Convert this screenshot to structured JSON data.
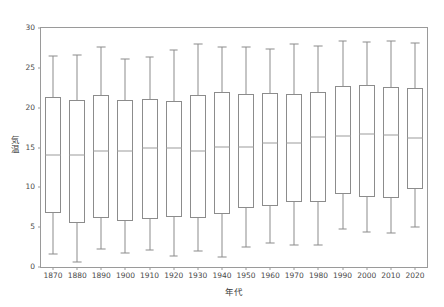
{
  "chart_data": {
    "type": "boxplot",
    "title": "",
    "xlabel": "年代",
    "ylabel": "気温",
    "ylim": [
      0,
      30
    ],
    "yticks": [
      0,
      5,
      10,
      15,
      20,
      25,
      30
    ],
    "ytick_labels": [
      "0",
      "5",
      "10",
      "15",
      "20",
      "25",
      "30"
    ],
    "grid": false,
    "legend": null,
    "categories": [
      "1870",
      "1880",
      "1890",
      "1900",
      "1910",
      "1920",
      "1930",
      "1940",
      "1950",
      "1960",
      "1970",
      "1980",
      "1990",
      "2000",
      "2010",
      "2020"
    ],
    "boxes": [
      {
        "category": "1870",
        "whisker_low": 1.6,
        "q1": 6.8,
        "median": 14.1,
        "q3": 21.3,
        "whisker_high": 26.5
      },
      {
        "category": "1880",
        "whisker_low": 0.6,
        "q1": 5.5,
        "median": 14.1,
        "q3": 20.9,
        "whisker_high": 26.6
      },
      {
        "category": "1890",
        "whisker_low": 2.2,
        "q1": 6.2,
        "median": 14.5,
        "q3": 21.6,
        "whisker_high": 27.6
      },
      {
        "category": "1900",
        "whisker_low": 1.7,
        "q1": 5.8,
        "median": 14.5,
        "q3": 20.9,
        "whisker_high": 26.1
      },
      {
        "category": "1910",
        "whisker_low": 2.1,
        "q1": 6.0,
        "median": 15.0,
        "q3": 21.1,
        "whisker_high": 26.4
      },
      {
        "category": "1920",
        "whisker_low": 1.4,
        "q1": 6.3,
        "median": 15.0,
        "q3": 20.8,
        "whisker_high": 27.3
      },
      {
        "category": "1930",
        "whisker_low": 2.0,
        "q1": 6.2,
        "median": 14.6,
        "q3": 21.6,
        "whisker_high": 28.0
      },
      {
        "category": "1940",
        "whisker_low": 1.3,
        "q1": 6.6,
        "median": 15.1,
        "q3": 22.0,
        "whisker_high": 27.6
      },
      {
        "category": "1950",
        "whisker_low": 2.5,
        "q1": 7.4,
        "median": 15.1,
        "q3": 21.7,
        "whisker_high": 27.6
      },
      {
        "category": "1960",
        "whisker_low": 3.0,
        "q1": 7.6,
        "median": 15.6,
        "q3": 21.9,
        "whisker_high": 27.4
      },
      {
        "category": "1970",
        "whisker_low": 2.7,
        "q1": 8.1,
        "median": 15.6,
        "q3": 21.7,
        "whisker_high": 28.0
      },
      {
        "category": "1980",
        "whisker_low": 2.8,
        "q1": 8.1,
        "median": 16.3,
        "q3": 22.0,
        "whisker_high": 27.8
      },
      {
        "category": "1990",
        "whisker_low": 4.8,
        "q1": 9.2,
        "median": 16.5,
        "q3": 22.7,
        "whisker_high": 28.4
      },
      {
        "category": "2000",
        "whisker_low": 4.4,
        "q1": 8.8,
        "median": 16.7,
        "q3": 22.9,
        "whisker_high": 28.2
      },
      {
        "category": "2010",
        "whisker_low": 4.3,
        "q1": 8.6,
        "median": 16.6,
        "q3": 22.6,
        "whisker_high": 28.4
      },
      {
        "category": "2020",
        "whisker_low": 5.0,
        "q1": 9.8,
        "median": 16.2,
        "q3": 22.5,
        "whisker_high": 28.1
      }
    ]
  },
  "style": {
    "frame_color": "#9a9a9a",
    "box_color": "#8c8c8c",
    "median_color": "#9c9c9c",
    "tick_label_color": "#4a4a4a",
    "background": "#ffffff"
  }
}
